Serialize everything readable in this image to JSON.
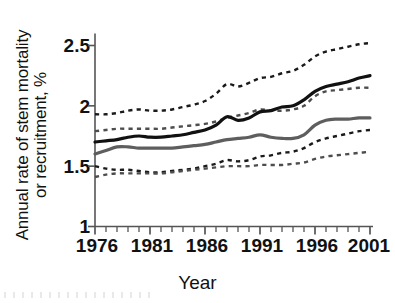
{
  "chart_data": {
    "type": "line",
    "title": "",
    "xlabel": "Year",
    "ylabel": "Annual rate of stem mortality or recruitment, %",
    "ylabel_lines": [
      "Annual rate of stem mortality",
      "or recruitment, %"
    ],
    "xlim": [
      1976,
      2001
    ],
    "ylim": [
      1,
      2.5
    ],
    "yticks": [
      "1",
      "1.5",
      "2",
      "2.5"
    ],
    "ytick_values": [
      1,
      1.5,
      2,
      2.5
    ],
    "xticks": [
      "1976",
      "1981",
      "1986",
      "1991",
      "1996",
      "2001"
    ],
    "xtick_values": [
      1976,
      1981,
      1986,
      1991,
      1996,
      2001
    ],
    "xtick_minor_step": 1,
    "grid": false,
    "legend": "none",
    "x": [
      1976,
      1977,
      1978,
      1979,
      1980,
      1981,
      1982,
      1983,
      1984,
      1985,
      1986,
      1987,
      1988,
      1989,
      1990,
      1991,
      1992,
      1993,
      1994,
      1995,
      1996,
      1997,
      1998,
      1999,
      2000,
      2001
    ],
    "series": [
      {
        "name": "Stem mortality rate",
        "style": "solid",
        "color": "#111111",
        "width": 3.2,
        "values": [
          1.7,
          1.71,
          1.72,
          1.74,
          1.75,
          1.74,
          1.74,
          1.75,
          1.76,
          1.78,
          1.8,
          1.84,
          1.91,
          1.88,
          1.9,
          1.95,
          1.96,
          1.99,
          2.0,
          2.05,
          2.12,
          2.16,
          2.18,
          2.2,
          2.23,
          2.25
        ]
      },
      {
        "name": "Stem mortality 95% CI upper",
        "style": "dashed",
        "color": "#1a1a1a",
        "width": 2.4,
        "values": [
          1.93,
          1.93,
          1.94,
          1.96,
          1.97,
          1.96,
          1.96,
          1.97,
          1.99,
          2.01,
          2.04,
          2.1,
          2.18,
          2.16,
          2.19,
          2.23,
          2.24,
          2.27,
          2.29,
          2.34,
          2.41,
          2.45,
          2.47,
          2.49,
          2.51,
          2.52
        ]
      },
      {
        "name": "Stem mortality 95% CI lower",
        "style": "dashed",
        "color": "#1a1a1a",
        "width": 2.4,
        "values": [
          1.5,
          1.48,
          1.47,
          1.47,
          1.46,
          1.45,
          1.45,
          1.46,
          1.47,
          1.48,
          1.5,
          1.52,
          1.55,
          1.54,
          1.55,
          1.58,
          1.59,
          1.61,
          1.62,
          1.65,
          1.7,
          1.73,
          1.75,
          1.77,
          1.79,
          1.8
        ]
      },
      {
        "name": "Stem recruitment rate",
        "style": "solid",
        "color": "#5e5e5e",
        "width": 3.2,
        "values": [
          1.6,
          1.63,
          1.66,
          1.66,
          1.65,
          1.65,
          1.65,
          1.65,
          1.66,
          1.67,
          1.68,
          1.7,
          1.72,
          1.73,
          1.74,
          1.76,
          1.74,
          1.73,
          1.73,
          1.76,
          1.84,
          1.88,
          1.89,
          1.89,
          1.9,
          1.9
        ]
      },
      {
        "name": "Stem recruitment 95% CI upper",
        "style": "dashed",
        "color": "#4d4d4d",
        "width": 2.4,
        "values": [
          1.79,
          1.8,
          1.81,
          1.81,
          1.81,
          1.81,
          1.81,
          1.82,
          1.83,
          1.84,
          1.85,
          1.87,
          1.9,
          1.92,
          1.94,
          1.97,
          1.96,
          1.96,
          1.97,
          2.0,
          2.08,
          2.12,
          2.13,
          2.14,
          2.15,
          2.15
        ]
      },
      {
        "name": "Stem recruitment 95% CI lower",
        "style": "dashed",
        "color": "#4d4d4d",
        "width": 2.4,
        "values": [
          1.41,
          1.43,
          1.44,
          1.44,
          1.44,
          1.44,
          1.44,
          1.45,
          1.46,
          1.47,
          1.48,
          1.49,
          1.5,
          1.5,
          1.5,
          1.51,
          1.51,
          1.51,
          1.52,
          1.53,
          1.56,
          1.58,
          1.59,
          1.6,
          1.61,
          1.62
        ]
      }
    ]
  },
  "axes": {
    "x_axis_label": "Year",
    "y_axis_label_line1": "Annual rate of stem mortality",
    "y_axis_label_line2": "or recruitment, %"
  }
}
